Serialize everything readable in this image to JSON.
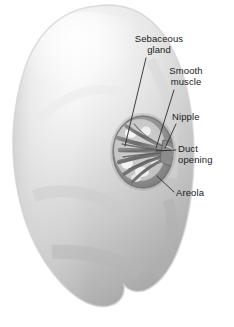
{
  "figure": {
    "background_color": "#ffffff",
    "width": 234,
    "height": 327,
    "style": "grayscale pencil/airbrush medical illustration"
  },
  "labels": [
    {
      "id": "sebaceous-gland",
      "text": "Sebaceous\ngland",
      "lines": [
        "Sebaceous",
        "gland"
      ],
      "align": "center",
      "leader": "diagonal line from lower-left of text down-left to the left edge of the areola"
    },
    {
      "id": "smooth-muscle",
      "text": "Smooth\nmuscle",
      "lines": [
        "Smooth",
        "muscle"
      ],
      "align": "center",
      "leader": "diagonal line from below text down-left into the nipple interior"
    },
    {
      "id": "nipple",
      "text": "Nipple",
      "lines": [
        "Nipple"
      ],
      "align": "left",
      "leader": "short diagonal line down-left to the nipple tip"
    },
    {
      "id": "duct-opening",
      "text": "Duct\nopening",
      "lines": [
        "Duct",
        "opening"
      ],
      "align": "left",
      "leader": "short horizontal line left to the duct openings at the nipple"
    },
    {
      "id": "areola",
      "text": "Areola",
      "lines": [
        "Areola"
      ],
      "align": "left",
      "leader": "diagonal line up-left to the lower-right rim of the areola"
    }
  ],
  "colors": {
    "background": "#ffffff",
    "text": "#1a1a1a",
    "leader_line": "#2b2b2b",
    "breast_highlight": "#fdfdfd",
    "breast_light": "#f2f2f2",
    "breast_mid": "#d9d9d9",
    "breast_shadow": "#a8a8a8",
    "breast_deep_shadow": "#8e8e8e",
    "areola_rim": "#7e7e7e",
    "areola_fill": "#9a9a9a",
    "duct_strand": "#6f6f6f",
    "duct_gap": "#f4f4f4"
  }
}
